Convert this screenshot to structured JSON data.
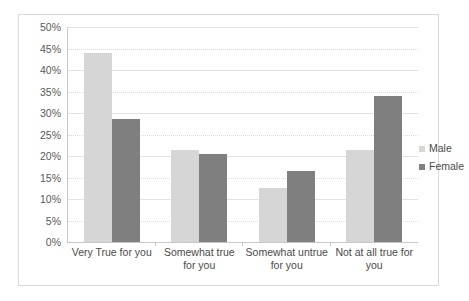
{
  "chart_data": {
    "type": "bar",
    "title": "",
    "subtitle": "",
    "xlabel": "",
    "ylabel": "",
    "categories": [
      "Very True for you",
      "Somewhat true for you",
      "Somewhat untrue for you",
      "Not at all true for you"
    ],
    "series": [
      {
        "name": "Male",
        "color": "#d6d6d6",
        "values": [
          44,
          21.5,
          12.5,
          21.5
        ]
      },
      {
        "name": "Female",
        "color": "#7f7f7f",
        "values": [
          28.5,
          20.5,
          16.5,
          34
        ]
      }
    ],
    "ylim": [
      0,
      50
    ],
    "ytick_step": 5,
    "ytick_labels": [
      "50%",
      "45%",
      "40%",
      "35%",
      "30%",
      "25%",
      "20%",
      "15%",
      "10%",
      "5%",
      "0%"
    ],
    "ytick_values": [
      50,
      45,
      40,
      35,
      30,
      25,
      20,
      15,
      10,
      5,
      0
    ],
    "grid": true,
    "legend_position": "right",
    "legend": [
      "Male",
      "Female"
    ],
    "border_color": "#d9d9d9",
    "gridline_color": "#e2e2e2",
    "axis_color": "#c8c8c8",
    "text_color": "#4a4a4a"
  }
}
